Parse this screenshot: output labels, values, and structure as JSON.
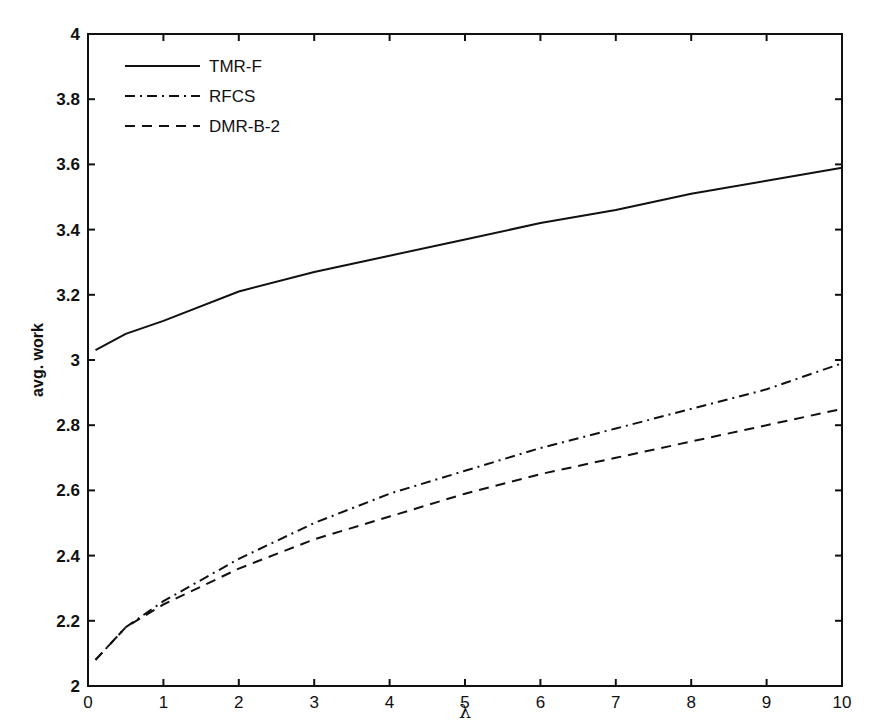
{
  "chart_data": {
    "type": "line",
    "title": "",
    "xlabel": "λ",
    "ylabel": "avg. work",
    "xlim": [
      0,
      10
    ],
    "ylim": [
      2,
      4
    ],
    "grid": false,
    "legend_position": "upper-left",
    "x_ticks": [
      "0",
      "1",
      "2",
      "3",
      "4",
      "5",
      "6",
      "7",
      "8",
      "9",
      "10"
    ],
    "y_ticks": [
      "2",
      "2.2",
      "2.4",
      "2.6",
      "2.8",
      "3",
      "3.2",
      "3.4",
      "3.6",
      "3.8",
      "4"
    ],
    "x": [
      0.1,
      0.5,
      1,
      2,
      3,
      4,
      5,
      6,
      7,
      8,
      9,
      10
    ],
    "series": [
      {
        "name": "TMR-F",
        "style": "solid",
        "values": [
          3.03,
          3.08,
          3.12,
          3.21,
          3.27,
          3.32,
          3.37,
          3.42,
          3.46,
          3.51,
          3.55,
          3.59
        ]
      },
      {
        "name": "RFCS",
        "style": "dashdot",
        "values": [
          2.08,
          2.18,
          2.26,
          2.39,
          2.5,
          2.59,
          2.66,
          2.73,
          2.79,
          2.85,
          2.91,
          2.99
        ]
      },
      {
        "name": "DMR-B-2",
        "style": "dashed",
        "values": [
          2.08,
          2.18,
          2.25,
          2.36,
          2.45,
          2.52,
          2.59,
          2.65,
          2.7,
          2.75,
          2.8,
          2.85
        ]
      }
    ]
  }
}
